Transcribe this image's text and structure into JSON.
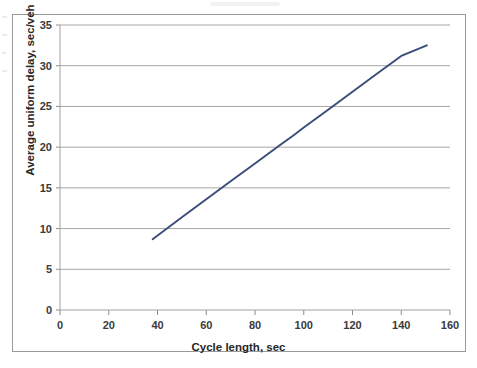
{
  "chart_data": {
    "type": "line",
    "title": "",
    "xlabel": "Cycle length, sec",
    "ylabel": "Average uniform delay, sec/veh",
    "xlim": [
      0,
      160
    ],
    "ylim": [
      0,
      35
    ],
    "xticks": [
      "0",
      "20",
      "40",
      "60",
      "80",
      "100",
      "120",
      "140",
      "160"
    ],
    "yticks": [
      "0",
      "5",
      "10",
      "15",
      "20",
      "25",
      "30",
      "35"
    ],
    "xtick_values": [
      0,
      20,
      40,
      60,
      80,
      100,
      120,
      140,
      160
    ],
    "ytick_values": [
      0,
      5,
      10,
      15,
      20,
      25,
      30,
      35
    ],
    "grid": "horizontal",
    "legend": "none",
    "series": [
      {
        "name": "Average uniform delay",
        "color": "#3b4b7a",
        "x": [
          38,
          50,
          60,
          70,
          80,
          90,
          96,
          100,
          110,
          120,
          130,
          140,
          150.5
        ],
        "values": [
          8.7,
          11.4,
          13.6,
          15.8,
          18.0,
          20.2,
          21.5,
          22.4,
          24.6,
          26.8,
          29.0,
          31.2,
          32.5
        ]
      }
    ],
    "annotations": []
  },
  "colors": {
    "line": "#3b4b7a",
    "grid": "#a6a6a6",
    "axis": "#8c8c8c",
    "frame": "#9a9a9a",
    "tick_text": "#3a3a3a",
    "title_text": "#262626",
    "background": "#ffffff"
  }
}
